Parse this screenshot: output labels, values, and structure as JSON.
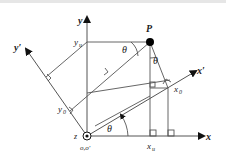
{
  "diagram": {
    "labels": {
      "y_axis": "y",
      "x_axis": "x",
      "y_prime": "y′",
      "x_prime": "x′",
      "point": "P",
      "yu": "y",
      "yu_sub": "u",
      "xu": "x",
      "xu_sub": "u",
      "x0": "x",
      "x0_sub": "0",
      "y0": "y",
      "y0_sub": "0",
      "z": "z",
      "origin": "o,o′",
      "theta_top": "θ",
      "theta_mid": "θ",
      "theta_bottom": "θ"
    },
    "colors": {
      "line": "#555555",
      "axis": "#111111",
      "point": "#000000"
    }
  }
}
